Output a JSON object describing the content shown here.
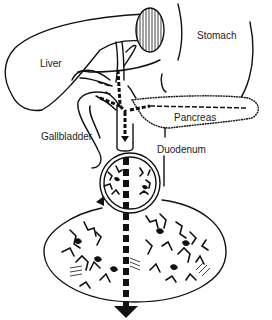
{
  "diagram": {
    "type": "anatomical-illustration",
    "labels": {
      "liver": "Liver",
      "stomach": "Stomach",
      "pancreas": "Pancreas",
      "gallbladder": "Gallbladder",
      "duodenum": "Duodenum"
    },
    "colors": {
      "line": "#111111",
      "background": "#ffffff"
    }
  }
}
